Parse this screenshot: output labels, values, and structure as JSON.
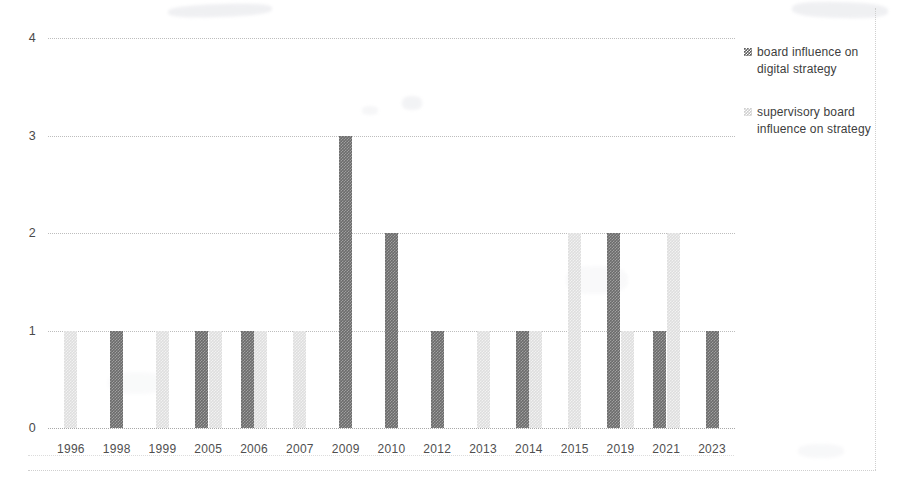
{
  "chart_data": {
    "type": "bar",
    "title": "",
    "subtitle": "",
    "xlabel": "",
    "ylabel": "",
    "ylim": [
      0,
      4
    ],
    "yticks": [
      "0",
      "1",
      "2",
      "3",
      "4"
    ],
    "grid": true,
    "legend_position": "right",
    "categories": [
      "1996",
      "1998",
      "1999",
      "2005",
      "2006",
      "2007",
      "2009",
      "2010",
      "2012",
      "2013",
      "2014",
      "2015",
      "2019",
      "2021",
      "2023"
    ],
    "series": [
      {
        "name": "board influence on digital strategy",
        "color": "#6b6b6b",
        "values": [
          0,
          1,
          0,
          1,
          1,
          0,
          3,
          2,
          1,
          0,
          1,
          0,
          2,
          1,
          1
        ]
      },
      {
        "name": "supervisory board influence on strategy",
        "color": "#dedede",
        "values": [
          1,
          0,
          1,
          1,
          1,
          1,
          0,
          0,
          0,
          1,
          1,
          2,
          1,
          2,
          0
        ]
      }
    ]
  },
  "legend": {
    "entries": [
      {
        "marker": "dark-hatched-swatch",
        "label": "board influence on digital strategy"
      },
      {
        "marker": "light-hatched-swatch",
        "label": "supervisory board influence on strategy"
      }
    ]
  }
}
